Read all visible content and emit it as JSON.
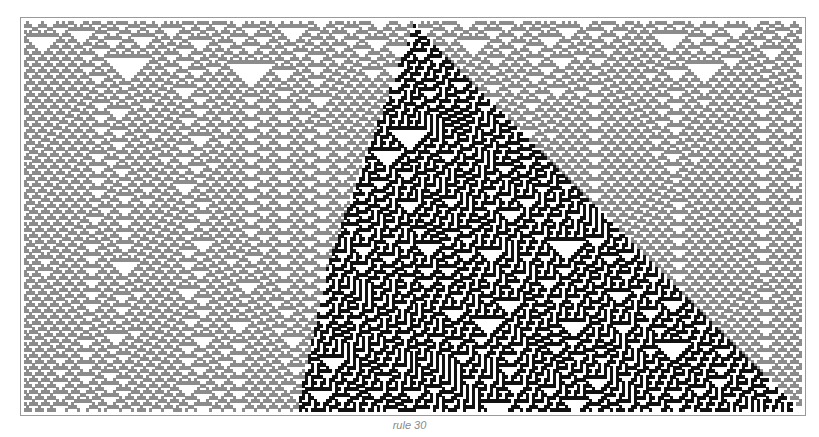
{
  "figure": {
    "caption": "rule 30",
    "rule_number": 30,
    "background_color": "#ffffff",
    "frame_color": "#9a9a9a",
    "cell_color_wedge": "#111111",
    "cell_color_background": "#8c8c8c",
    "grid": {
      "columns": 260,
      "rows": 130
    },
    "wedge": {
      "apex": [
        0.5,
        0.0
      ],
      "right_edge_end": [
        0.995,
        1.0
      ],
      "left_edge_points": [
        [
          0.5,
          0.0
        ],
        [
          0.44,
          0.33
        ],
        [
          0.39,
          0.62
        ],
        [
          0.35,
          1.0
        ]
      ]
    }
  }
}
